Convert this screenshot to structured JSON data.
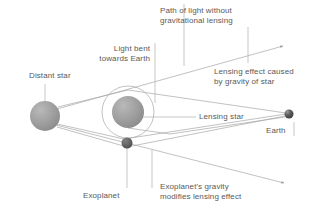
{
  "figure": {
    "background_color": "#ffffff",
    "line_color": "#9a9a9a",
    "text_color": "#595959",
    "star_color": "#9d9d9d",
    "planet_color": "#5e5e5e"
  },
  "labels": {
    "path_without_lensing": "Path of light without\ngravitational lensing",
    "light_bent": "Light bent\ntowards Earth",
    "lensing_effect_star": "Lensing effect caused\nby gravity of star",
    "distant_star": "Distant star",
    "lensing_star": "Lensing star",
    "earth": "Earth",
    "exoplanet": "Exoplanet",
    "exoplanet_gravity": "Exoplanet's gravity\nmodifies lensing effect"
  },
  "bodies": [
    {
      "name": "distant-star",
      "label": "Distant star",
      "cx": 45,
      "cy": 116,
      "r": 15,
      "color": "#9d9d9d"
    },
    {
      "name": "lensing-star",
      "label": "Lensing star",
      "cx": 128,
      "cy": 112,
      "r": 16,
      "color": "#9d9d9d"
    },
    {
      "name": "exoplanet",
      "label": "Exoplanet",
      "cx": 127,
      "cy": 143,
      "r": 5.5,
      "color": "#5e5e5e"
    },
    {
      "name": "earth",
      "label": "Earth",
      "cx": 289,
      "cy": 114,
      "r": 4.5,
      "color": "#4f4f4f"
    }
  ],
  "lensing_ring": {
    "cx": 128,
    "cy": 112,
    "r": 26
  },
  "rays": {
    "straight_upper": {
      "from": [
        58,
        108
      ],
      "to": [
        286,
        45
      ],
      "arrow": true
    },
    "straight_lower": {
      "from": [
        57,
        126
      ],
      "to": [
        287,
        184
      ],
      "arrow": true
    },
    "bent_upper": {
      "via": [
        128,
        90
      ],
      "to": [
        286,
        113
      ]
    },
    "bent_lower": {
      "via": [
        125,
        139
      ],
      "to": [
        286,
        115
      ]
    },
    "planet_ray": {
      "via": [
        127,
        146
      ],
      "to": [
        286,
        116
      ]
    }
  }
}
